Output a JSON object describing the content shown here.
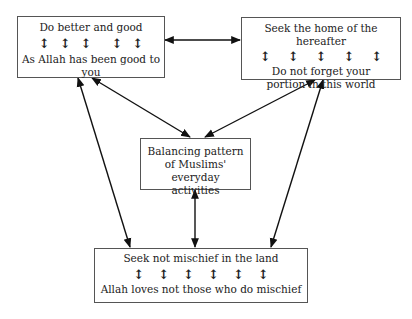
{
  "diagram": {
    "boxes": {
      "top_left": {
        "line1": "Do better and good",
        "line2": "As Allah has been good to you",
        "arrow_count": 5
      },
      "top_right": {
        "line1": "Seek the home of the hereafter",
        "line2": "Do not forget your portion in this world",
        "arrow_count": 5
      },
      "center": {
        "text": "Balancing pattern of Muslims' everyday activities"
      },
      "bottom": {
        "line1": "Seek not mischief in the land",
        "line2": "Allah loves not those who do mischief",
        "arrow_count": 6
      }
    },
    "arrow_glyph": "↕",
    "connections": [
      {
        "from": "top_left",
        "to": "top_right",
        "type": "bidirectional"
      },
      {
        "from": "top_left",
        "to": "center",
        "type": "bidirectional"
      },
      {
        "from": "top_right",
        "to": "center",
        "type": "bidirectional"
      },
      {
        "from": "top_left",
        "to": "bottom",
        "type": "bidirectional"
      },
      {
        "from": "top_right",
        "to": "bottom",
        "type": "bidirectional"
      },
      {
        "from": "center",
        "to": "bottom",
        "type": "bidirectional"
      }
    ]
  }
}
